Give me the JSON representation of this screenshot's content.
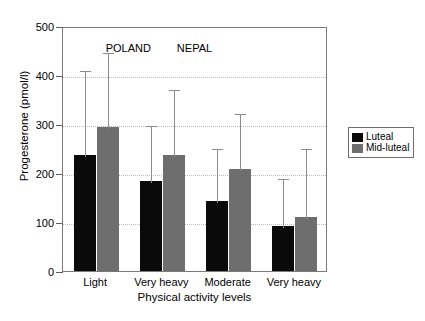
{
  "header": {
    "running_head": "",
    "page_number": ""
  },
  "chart_data": {
    "type": "bar",
    "title": "",
    "xlabel": "Physical activity levels",
    "ylabel": "Progesterone (pmol/l)",
    "ylim": [
      0,
      500
    ],
    "yticks": [
      0,
      100,
      200,
      300,
      400,
      500
    ],
    "ytick_labels": [
      "0",
      "100",
      "200",
      "300",
      "400",
      "500"
    ],
    "grid": "horizontal-dotted",
    "legend_position": "right-outside",
    "categories": [
      "Light",
      "Very heavy",
      "Moderate",
      "Very heavy"
    ],
    "group_annotations": [
      {
        "label": "POLAND",
        "categories": [
          "Light",
          "Very heavy"
        ]
      },
      {
        "label": "NEPAL",
        "categories": [
          "Moderate",
          "Very heavy"
        ]
      }
    ],
    "series": [
      {
        "name": "Luteal",
        "color": "#0a0a0a",
        "values": [
          237,
          184,
          143,
          92
        ],
        "error_upper": [
          412,
          300,
          253,
          192
        ]
      },
      {
        "name": "Mid-luteal",
        "color": "#6e6e6e",
        "values": [
          294,
          237,
          208,
          110
        ],
        "error_upper": [
          449,
          373,
          324,
          253
        ]
      }
    ]
  }
}
